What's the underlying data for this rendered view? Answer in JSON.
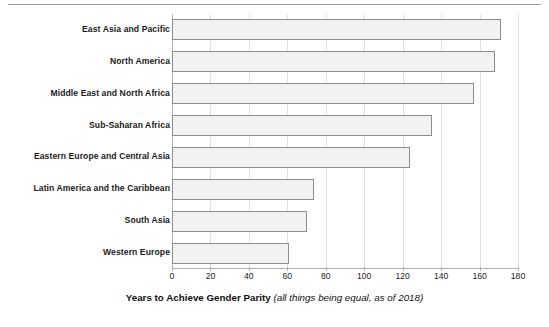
{
  "figure": {
    "width": 549,
    "height": 327,
    "background": "#ffffff",
    "top_rule": "horizontal-divider"
  },
  "axis_title": {
    "main": "Years to Achieve Gender Parity",
    "note": "(all things being equal, as of 2018)"
  },
  "colors": {
    "bar_fill": "#f2f2f2",
    "bar_border": "#8c8c8c",
    "gridline": "#e3e3e3",
    "axis_line": "#b0b0b0",
    "text": "#1a1a1a"
  },
  "chart_data": {
    "type": "bar",
    "orientation": "horizontal",
    "title": "",
    "subtitle": "",
    "xlabel": "Years to Achieve Gender Parity (all things being equal, as of 2018)",
    "ylabel": "",
    "xlim": [
      0,
      180
    ],
    "ylim": null,
    "grid": true,
    "legend": null,
    "xticks": [
      0,
      20,
      40,
      60,
      80,
      100,
      120,
      140,
      160,
      180
    ],
    "tick_labels": [
      "0",
      "20",
      "40",
      "60",
      "80",
      "100",
      "120",
      "140",
      "160",
      "180"
    ],
    "categories": [
      "East Asia and Pacific",
      "North America",
      "Middle East and North Africa",
      "Sub-Saharan Africa",
      "Eastern Europe and Central Asia",
      "Latin America and the Caribbean",
      "South Asia",
      "Western Europe"
    ],
    "values": [
      171,
      168,
      157,
      135,
      124,
      74,
      70,
      61
    ],
    "series": [
      {
        "name": "Years to Achieve Gender Parity",
        "values": [
          171,
          168,
          157,
          135,
          124,
          74,
          70,
          61
        ]
      }
    ]
  }
}
